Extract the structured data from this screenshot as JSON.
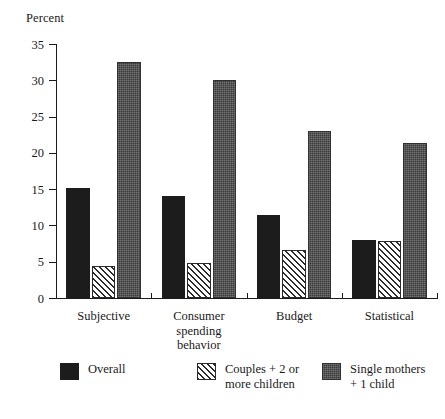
{
  "chart_data": {
    "type": "bar",
    "title": "",
    "subtitle": "",
    "xlabel": "",
    "ylabel": "Percent",
    "ylim": [
      0,
      35
    ],
    "yticks": [
      0,
      5,
      10,
      15,
      20,
      25,
      30,
      35
    ],
    "ytick_labels": [
      "0",
      "5",
      "10",
      "15",
      "20",
      "25",
      "30",
      "35"
    ],
    "grid": false,
    "legend_position": "below-axis",
    "categories": [
      "Subjective",
      "Consumer\nspending\nbehavior",
      "Budget",
      "Statistical"
    ],
    "series": [
      {
        "name": "Overall",
        "pattern": "solid",
        "color": "#1c1c1c",
        "values": [
          15.1,
          14.0,
          11.5,
          8.0
        ]
      },
      {
        "name": "Couples + 2 or\nmore children",
        "pattern": "diagonal-hatch",
        "color": "#2a2a2a",
        "values": [
          4.4,
          4.8,
          6.6,
          7.9
        ]
      },
      {
        "name": "Single mothers\n+ 1  child",
        "pattern": "dark-texture",
        "color": "#3b3b3b",
        "values": [
          32.5,
          30.0,
          23.0,
          21.3
        ]
      }
    ]
  }
}
